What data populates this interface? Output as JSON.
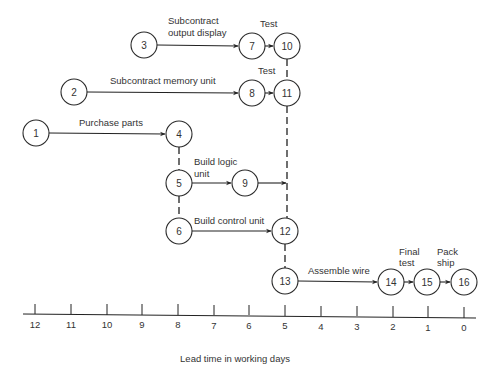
{
  "diagram": {
    "type": "network-schedule",
    "axis": {
      "title": "Lead time in working days",
      "ticks": [
        "12",
        "11",
        "10",
        "9",
        "8",
        "7",
        "6",
        "5",
        "4",
        "3",
        "2",
        "1",
        "0"
      ]
    },
    "nodes": [
      {
        "id": "1",
        "label": "1"
      },
      {
        "id": "2",
        "label": "2"
      },
      {
        "id": "3",
        "label": "3"
      },
      {
        "id": "4",
        "label": "4"
      },
      {
        "id": "5",
        "label": "5"
      },
      {
        "id": "6",
        "label": "6"
      },
      {
        "id": "7",
        "label": "7"
      },
      {
        "id": "8",
        "label": "8"
      },
      {
        "id": "9",
        "label": "9"
      },
      {
        "id": "10",
        "label": "10"
      },
      {
        "id": "11",
        "label": "11"
      },
      {
        "id": "12",
        "label": "12"
      },
      {
        "id": "13",
        "label": "13"
      },
      {
        "id": "14",
        "label": "14"
      },
      {
        "id": "15",
        "label": "15"
      },
      {
        "id": "16",
        "label": "16"
      }
    ],
    "activities": {
      "subcontract_output_display_1": "Subcontract",
      "subcontract_output_display_2": "output display",
      "test_top": "Test",
      "subcontract_memory_unit": "Subcontract memory unit",
      "test_mid": "Test",
      "purchase_parts": "Purchase parts",
      "build_logic_unit_1": "Build logic",
      "build_logic_unit_2": "unit",
      "build_control_unit": "Build control unit",
      "assemble_wire": "Assemble wire",
      "final_test_1": "Final",
      "final_test_2": "test",
      "pack_ship_1": "Pack",
      "pack_ship_2": "ship"
    }
  }
}
